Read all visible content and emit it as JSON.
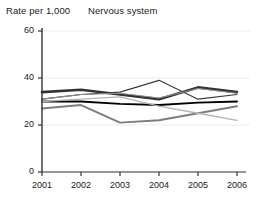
{
  "chart_data": {
    "type": "line",
    "title": "Nervous system",
    "ylabel": "Rate per 1,000",
    "xlabel": "",
    "categories": [
      "2001",
      "2002",
      "2003",
      "2004",
      "2005",
      "2006"
    ],
    "x": [
      2001,
      2002,
      2003,
      2004,
      2005,
      2006
    ],
    "ylim": [
      0,
      60
    ],
    "yticks": [
      0,
      20,
      40,
      60
    ],
    "ytick_labels": [
      "0",
      "20",
      "40",
      "60"
    ],
    "grid": "horizontal-faint",
    "legend": "none",
    "series": [
      {
        "name": "series-1-dark-thick",
        "color": "#333333",
        "width": 2.6,
        "values": [
          34,
          35,
          33,
          31,
          36,
          34
        ]
      },
      {
        "name": "series-2-black-thin",
        "color": "#000000",
        "width": 1.9,
        "values": [
          30,
          30,
          29,
          28.5,
          29.5,
          30
        ]
      },
      {
        "name": "series-3-dark-thin",
        "color": "#3a3a3a",
        "width": 1.1,
        "values": [
          31,
          33,
          34,
          39,
          31,
          33
        ]
      },
      {
        "name": "series-4-mid-gray",
        "color": "#7d7d7d",
        "width": 1.9,
        "values": [
          27,
          28.5,
          21,
          22,
          25,
          28
        ]
      },
      {
        "name": "series-5-light-gray",
        "color": "#b5b5b5",
        "width": 1.3,
        "values": [
          30,
          31,
          32,
          28,
          25,
          22
        ]
      },
      {
        "name": "series-6-gray-thin",
        "color": "#8f8f8f",
        "width": 1.1,
        "values": [
          31,
          33,
          33.5,
          31.5,
          35.5,
          33.5
        ]
      }
    ]
  },
  "axes": {
    "y_axis_name": "y-axis",
    "x_axis_name": "x-axis"
  }
}
